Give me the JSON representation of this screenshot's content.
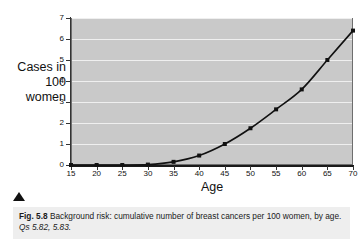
{
  "figure": {
    "caption_number": "Fig. 5.8",
    "caption_text": "Background risk: cumulative number of breast cancers per 100 women, by age.",
    "caption_reference": "Qs 5.82, 5.83.",
    "marker_icon": "triangle-up-icon"
  },
  "chart_data": {
    "type": "line",
    "title": "",
    "xlabel": "Age",
    "ylabel": "Cases in 100 women",
    "ylabel_lines": [
      "Cases in",
      "100",
      "women"
    ],
    "x": [
      15,
      20,
      25,
      30,
      35,
      40,
      45,
      50,
      55,
      60,
      65,
      70
    ],
    "values": [
      0,
      0,
      0,
      0.02,
      0.15,
      0.45,
      1.0,
      1.75,
      2.65,
      3.6,
      5.0,
      6.4
    ],
    "series": [
      {
        "name": "Cumulative breast cancers per 100 women",
        "values": [
          0,
          0,
          0,
          0.02,
          0.15,
          0.45,
          1.0,
          1.75,
          2.65,
          3.6,
          5.0,
          6.4
        ]
      }
    ],
    "xlim": [
      15,
      70
    ],
    "ylim": [
      0,
      7
    ],
    "xticks": [
      15,
      20,
      25,
      30,
      35,
      40,
      45,
      50,
      55,
      60,
      65,
      70
    ],
    "yticks": [
      0,
      1,
      2,
      3,
      4,
      5,
      6,
      7
    ],
    "xtick_labels": [
      "15",
      "20",
      "25",
      "30",
      "35",
      "40",
      "45",
      "50",
      "55",
      "60",
      "65",
      "70"
    ],
    "ytick_labels": [
      "0",
      "1",
      "2",
      "3",
      "4",
      "5",
      "6",
      "7"
    ],
    "grid": true,
    "grid_orientation": "horizontal",
    "legend": false,
    "marker": "square",
    "plot_background_color": "#c9c9c9",
    "grid_color": "#efefef",
    "line_color": "#111111",
    "page_background_color": "#ffffff",
    "caption_background_color": "#eeeeee"
  }
}
